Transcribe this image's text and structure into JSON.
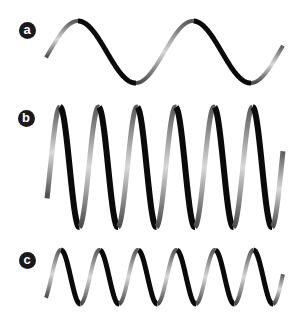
{
  "figure": {
    "background": "#ffffff",
    "ribbon_dark": "#0a0a0a",
    "ribbon_light": "#d8d8d8",
    "ribbon_mid": "#6a6a6a",
    "panels": [
      {
        "label": "a",
        "label_center": [
          27,
          30
        ],
        "wave": {
          "x_start": 46,
          "x_end": 283,
          "center_y": 52,
          "amplitude": 31,
          "period": 115,
          "phase_peak_x": 78,
          "ribbon_width": 5
        }
      },
      {
        "label": "b",
        "label_center": [
          26,
          118
        ],
        "wave": {
          "x_start": 47,
          "x_end": 283,
          "center_y": 167,
          "amplitude": 60,
          "period": 38.5,
          "phase_peak_x": 60,
          "ribbon_width": 6
        }
      },
      {
        "label": "c",
        "label_center": [
          27,
          260
        ],
        "wave": {
          "x_start": 46,
          "x_end": 283,
          "center_y": 277,
          "amplitude": 27,
          "period": 38.5,
          "phase_peak_x": 61,
          "ribbon_width": 5
        }
      }
    ]
  }
}
